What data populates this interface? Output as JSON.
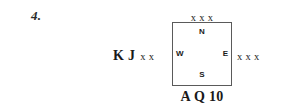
{
  "problem": {
    "number": "4."
  },
  "compass": {
    "north": "N",
    "south": "S",
    "west": "W",
    "east": "E",
    "border_color": "#5a5a5a"
  },
  "hands": {
    "north": {
      "position": "North",
      "cards": [
        "x",
        "x",
        "x"
      ],
      "text": "x x x"
    },
    "west": {
      "position": "West",
      "cards": [
        "K",
        "J",
        "x",
        "x"
      ],
      "honours": "K J",
      "spots": "x x",
      "text": "K J x x"
    },
    "east": {
      "position": "East",
      "cards": [
        "x",
        "x",
        "x"
      ],
      "text": "x x x"
    },
    "south": {
      "position": "South",
      "cards": [
        "A",
        "Q",
        "10"
      ],
      "text": "A Q 10"
    }
  }
}
